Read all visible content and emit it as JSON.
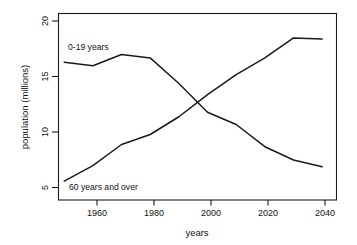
{
  "chart_data": {
    "type": "line",
    "title": "",
    "xlabel": "years",
    "ylabel": "population (millions)",
    "xlim": [
      1948,
      2045
    ],
    "ylim": [
      4.0,
      20.8
    ],
    "grid": false,
    "legend_position": "inline-annotations",
    "x": [
      1950,
      1960,
      1970,
      1980,
      1990,
      2000,
      2010,
      2020,
      2030,
      2040
    ],
    "xticks": [
      1960,
      1980,
      2000,
      2020,
      2040
    ],
    "xtick_labels": [
      "1960",
      "1980",
      "2000",
      "2020",
      "2040"
    ],
    "yticks": [
      5,
      10,
      15,
      20
    ],
    "ytick_labels": [
      "5",
      "10",
      "15",
      "20"
    ],
    "series": [
      {
        "name": "0-19 years",
        "label": "0-19 years",
        "color": "#1a1a1a",
        "values": [
          16.4,
          16.1,
          17.1,
          16.8,
          14.5,
          11.9,
          10.8,
          8.8,
          7.6,
          7.0
        ]
      },
      {
        "name": "60 years and over",
        "label": "60 years and over",
        "color": "#1a1a1a",
        "values": [
          5.7,
          7.1,
          9.0,
          9.9,
          11.5,
          13.5,
          15.3,
          16.8,
          18.6,
          18.5
        ]
      }
    ],
    "annotations": [
      {
        "text": "0-19 years",
        "x": 1952,
        "y": 17.2
      },
      {
        "text": "60 years and over",
        "x": 1952.5,
        "y": 4.9
      }
    ]
  }
}
